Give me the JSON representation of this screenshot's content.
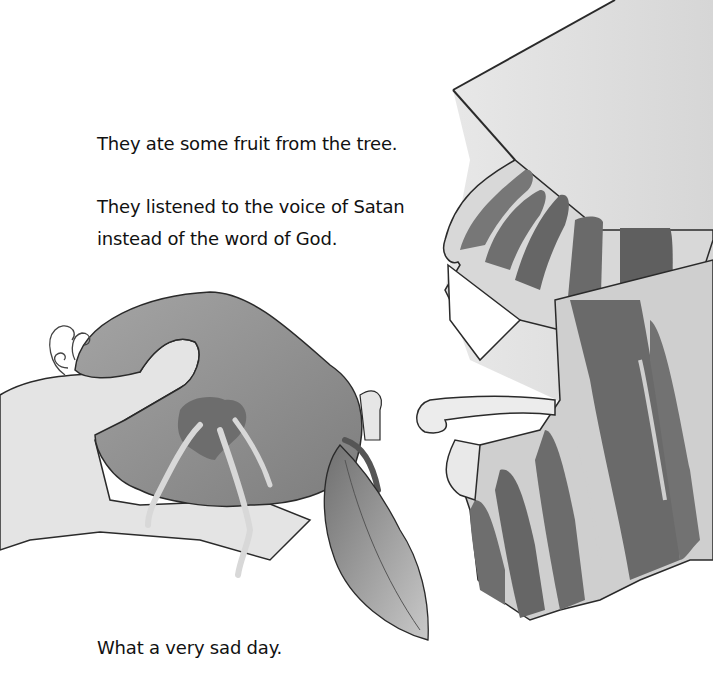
{
  "page": {
    "text_blocks": [
      {
        "line": "They ate some fruit from the tree."
      },
      {
        "lines": [
          "They listened to the voice of Satan",
          "instead of the word of God."
        ]
      },
      {
        "line": "What a very sad day."
      }
    ]
  },
  "illustration": {
    "description": "Grayscale watercolor: a hand holding a bitten fruit with leaf and stem on the left, a figure's striped robe sleeve and hand reaching from the right",
    "colors": {
      "outline": "#2a2a2a",
      "skin_light": "#e6e6e6",
      "fruit": "#9a9a9a",
      "fruit_dark": "#7a7a7a",
      "robe_light": "#e2e2e2",
      "robe_stripe": "#6e6e6e",
      "leaf": "#8c8c8c"
    }
  }
}
